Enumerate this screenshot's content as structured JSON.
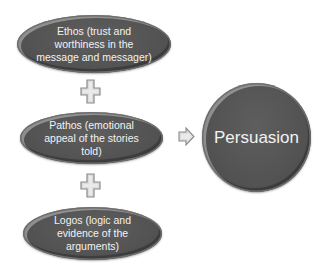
{
  "diagram": {
    "type": "process",
    "inputs": [
      {
        "id": "ethos",
        "label": "Ethos (trust and worthiness in the message and messager)"
      },
      {
        "id": "pathos",
        "label": "Pathos (emotional appeal of the stories told)"
      },
      {
        "id": "logos",
        "label": "Logos (logic and evidence of the arguments)"
      }
    ],
    "connectors": [
      {
        "type": "plus",
        "between": [
          "ethos",
          "pathos"
        ]
      },
      {
        "type": "plus",
        "between": [
          "pathos",
          "logos"
        ]
      },
      {
        "type": "arrow",
        "from": "pathos",
        "to": "persuasion"
      }
    ],
    "result": {
      "id": "persuasion",
      "label": "Persuasion"
    }
  },
  "icons": {
    "plus": "plus-icon",
    "arrow": "arrow-right-icon"
  },
  "colors": {
    "shape_fill": "#555555",
    "shape_text": "#f2f2f2",
    "connector_fill": "#dcdcdc",
    "connector_stroke": "#8a8a8a",
    "background": "#ffffff"
  }
}
